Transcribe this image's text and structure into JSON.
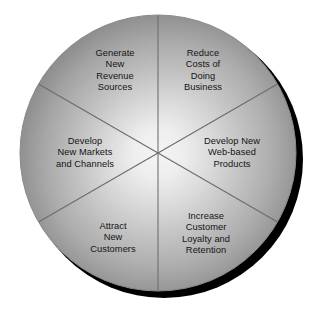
{
  "figure": {
    "name": "six-sector-strategy-wheel",
    "background_color": "#ffffff",
    "shadow_color": "#000000",
    "divider_color": "#6b6b6b",
    "text_color": "#141414",
    "gradient_center_color": "#f2f2f2",
    "gradient_rim_color": "#969696"
  },
  "wheel": {
    "center_x": 158,
    "center_y": 153,
    "radius": 138,
    "sector_count": 6,
    "sectors": [
      {
        "id": "generate-new-revenue-sources",
        "lines": [
          "Generate",
          "New",
          "Revenue",
          "Sources"
        ],
        "label_x": 115,
        "label_y": 71,
        "start_angle": -90,
        "end_angle": -30
      },
      {
        "id": "reduce-costs-of-doing-business",
        "lines": [
          "Reduce",
          "Costs of",
          "Doing",
          "Business"
        ],
        "label_x": 203,
        "label_y": 71,
        "start_angle": -90,
        "end_angle": -30
      },
      {
        "id": "develop-new-markets-and-channels",
        "lines": [
          "Develop",
          "New Markets",
          "and Channels"
        ],
        "label_x": 85,
        "label_y": 153,
        "start_angle": 150,
        "end_angle": 210
      },
      {
        "id": "develop-new-web-based-products",
        "lines": [
          "Develop New",
          "Web-based",
          "Products"
        ],
        "label_x": 232,
        "label_y": 153,
        "start_angle": -30,
        "end_angle": 30
      },
      {
        "id": "attract-new-customers",
        "lines": [
          "Attract",
          "New",
          "Customers"
        ],
        "label_x": 113,
        "label_y": 238,
        "start_angle": 90,
        "end_angle": 150
      },
      {
        "id": "increase-customer-loyalty-and-retention",
        "lines": [
          "Increase",
          "Customer",
          "Loyalty and",
          "Retention"
        ],
        "label_x": 206,
        "label_y": 234,
        "start_angle": 30,
        "end_angle": 90
      }
    ]
  }
}
